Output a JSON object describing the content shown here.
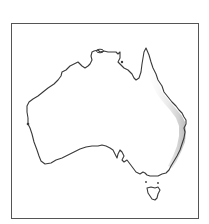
{
  "map": {
    "subject": "Australia",
    "highlighted_region": "Eastern coastal strip (Queensland / New South Wales)",
    "colors": {
      "background": "#ffffff",
      "frame": "#555555",
      "coastline": "#3a3a3a",
      "land": "#ffffff",
      "highlight": "#c8c8c8"
    },
    "features": [
      "mainland",
      "tasmania",
      "east-coast-shading"
    ]
  }
}
